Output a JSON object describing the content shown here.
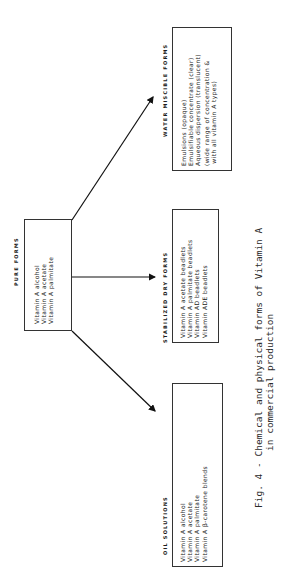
{
  "pure_forms": {
    "heading": "PURE FORMS",
    "items": [
      "Vitamin A alcohol",
      "Vitamin A acetate",
      "Vitamin A palmitate"
    ]
  },
  "water_miscible_forms": {
    "heading": "WATER MISCIBLE FORMS",
    "items": [
      "Emulsions (opaque)",
      "Emulsifiable concentrate (clear)",
      "Aqueous dispersion (translucent)",
      "(wide range of concentration &",
      " with all vitamin A types)"
    ]
  },
  "stabilized_dry_forms": {
    "heading": "STABILIZED DRY FORMS",
    "items": [
      "Vitamin A acetate beadlets",
      "Vitamin A palmitate beadlets",
      "Vitamin AD beadlets",
      "Vitamin ADE beadlets"
    ]
  },
  "oil_solutions": {
    "heading": "OIL SOLUTIONS",
    "items": [
      "Vitamin A alcohol",
      "Vitamin A acetate",
      "Vitamin A palmitate",
      "Vitamin A β-carotene blends"
    ]
  },
  "caption": {
    "line1": "Fig. 4 - Chemical and physical forms of Vitamin A",
    "line2": "in commercial production"
  }
}
